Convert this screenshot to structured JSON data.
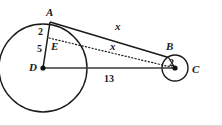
{
  "figure": {
    "background_color": "#ffffff",
    "stroke_color": "#1a1a1a",
    "points": {
      "A": {
        "label": "A",
        "x": 50,
        "y": 22
      },
      "B": {
        "label": "B",
        "x": 168,
        "y": 57
      },
      "C": {
        "label": "C",
        "x": 175,
        "y": 68
      },
      "D": {
        "label": "D",
        "x": 43,
        "y": 68
      },
      "E": {
        "label": "E",
        "x": 49,
        "y": 40
      }
    },
    "point_labels": {
      "A": "A",
      "B": "B",
      "C": "C",
      "D": "D",
      "E": "E"
    },
    "measures": {
      "AE": "2",
      "ED": "5",
      "radius_small": "2",
      "DC": "13",
      "tangent_AB": "x",
      "segment_EC": "x"
    },
    "circles": [
      {
        "name": "large-circle",
        "center": "D",
        "cx": 43,
        "cy": 68,
        "r": 44
      },
      {
        "name": "small-circle",
        "center": "C",
        "cx": 175,
        "cy": 68,
        "r": 13
      }
    ],
    "segments": [
      {
        "name": "tangent-line-AB",
        "from": "A",
        "to": "B",
        "style": "solid",
        "label": "x"
      },
      {
        "name": "segment-AD",
        "from": "A",
        "to": "D",
        "style": "solid",
        "label": ""
      },
      {
        "name": "segment-EC",
        "from": "E",
        "to": "C",
        "style": "dotted",
        "label": "x"
      },
      {
        "name": "segment-DC",
        "from": "D",
        "to": "C",
        "style": "solid",
        "label": "13"
      },
      {
        "name": "radius-CB",
        "from": "C",
        "to": "B",
        "style": "solid",
        "label": "2"
      }
    ]
  }
}
